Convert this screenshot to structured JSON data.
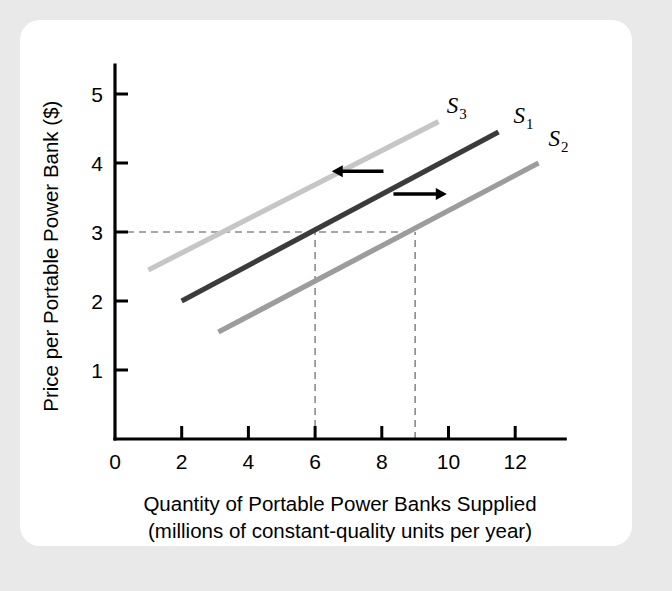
{
  "figure": {
    "background_color": "#e9e9e9",
    "card_color": "#ffffff"
  },
  "chart_data": {
    "type": "line",
    "title": "",
    "xlabel_line1": "Quantity of Portable Power Banks Supplied",
    "xlabel_line2": "(millions of constant-quality units per year)",
    "ylabel": "Price per Portable Power Bank ($)",
    "xlim": [
      0,
      13.5
    ],
    "ylim": [
      0,
      5.5
    ],
    "xticks": [
      0,
      2,
      4,
      6,
      8,
      10,
      12
    ],
    "xtick_labels": [
      "0",
      "2",
      "4",
      "6",
      "8",
      "10",
      "12"
    ],
    "yticks": [
      1,
      2,
      3,
      4,
      5
    ],
    "ytick_labels": [
      "1",
      "2",
      "3",
      "4",
      "5"
    ],
    "grid": false,
    "legend_position": "inline-curve-labels",
    "series": [
      {
        "name": "S1",
        "label": "S",
        "subscript": "1",
        "color": "#3b3b3b",
        "role": "original-supply",
        "x": [
          2,
          11.5
        ],
        "y": [
          2.0,
          4.45
        ],
        "label_x": 11.95,
        "label_y": 4.58
      },
      {
        "name": "S2",
        "label": "S",
        "subscript": "2",
        "color": "#9c9c9c",
        "role": "increase-in-supply",
        "x": [
          3.1,
          12.7
        ],
        "y": [
          1.55,
          4.0
        ],
        "label_x": 13.0,
        "label_y": 4.25
      },
      {
        "name": "S3",
        "label": "S",
        "subscript": "3",
        "color": "#c6c6c6",
        "role": "decrease-in-supply",
        "x": [
          1.0,
          9.7
        ],
        "y": [
          2.45,
          4.6
        ],
        "label_x": 9.95,
        "label_y": 4.72
      }
    ],
    "reference_lines": [
      {
        "name": "price-reference",
        "orientation": "horizontal",
        "value": 3,
        "from_x": 0,
        "to_x": 9
      },
      {
        "name": "quantity-reference-s1",
        "orientation": "vertical",
        "value": 6,
        "from_y": 0,
        "to_y": 3
      },
      {
        "name": "quantity-reference-s2",
        "orientation": "vertical",
        "value": 9,
        "from_y": 0,
        "to_y": 3
      }
    ],
    "annotations": [
      {
        "name": "decrease-supply-arrow",
        "direction": "left",
        "from_x": 8.05,
        "to_x": 6.5,
        "y": 3.88
      },
      {
        "name": "increase-supply-arrow",
        "direction": "right",
        "from_x": 8.35,
        "to_x": 9.95,
        "y": 3.55
      }
    ]
  }
}
